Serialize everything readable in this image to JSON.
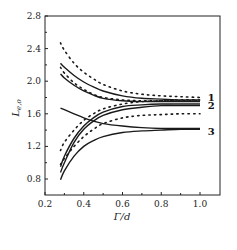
{
  "chart_data": {
    "type": "line",
    "title": "",
    "xlabel": "Γ/d",
    "ylabel": "L_{e,o}",
    "xlim": [
      0.2,
      1.1
    ],
    "ylim": [
      0.6,
      2.8
    ],
    "xticks": [
      0.2,
      0.4,
      0.6,
      0.8,
      1.0
    ],
    "xtick_labels": [
      "0.2",
      "0.4",
      "0.6",
      "0.8",
      "1.0"
    ],
    "yticks": [
      0.8,
      1.2,
      1.6,
      2.0,
      2.4,
      2.8
    ],
    "ytick_labels": [
      "0.8",
      "1.2",
      "1.6",
      "2.0",
      "2.4",
      "2.8"
    ],
    "grid": false,
    "x": [
      0.28,
      0.3,
      0.35,
      0.4,
      0.45,
      0.5,
      0.6,
      0.7,
      0.8,
      0.9,
      1.0
    ],
    "series": [
      {
        "name": "1 (solid, upper)",
        "style": "solid",
        "values": [
          2.22,
          2.17,
          2.07,
          1.99,
          1.93,
          1.88,
          1.82,
          1.79,
          1.78,
          1.77,
          1.77
        ]
      },
      {
        "name": "1 (solid, lower)",
        "style": "solid",
        "values": [
          2.09,
          2.04,
          1.95,
          1.88,
          1.83,
          1.79,
          1.76,
          1.75,
          1.75,
          1.75,
          1.75
        ]
      },
      {
        "name": "1 (dotted, upper)",
        "style": "dotted",
        "values": [
          2.47,
          2.38,
          2.22,
          2.11,
          2.03,
          1.96,
          1.88,
          1.84,
          1.82,
          1.81,
          1.8
        ]
      },
      {
        "name": "1 (dotted, lower)",
        "style": "dotted",
        "values": [
          2.17,
          2.1,
          1.98,
          1.9,
          1.84,
          1.8,
          1.77,
          1.76,
          1.76,
          1.76,
          1.76
        ]
      },
      {
        "name": "2 (solid, upper)",
        "style": "solid",
        "values": [
          0.95,
          1.08,
          1.3,
          1.45,
          1.55,
          1.62,
          1.69,
          1.71,
          1.72,
          1.72,
          1.72
        ]
      },
      {
        "name": "2 (solid, lower)",
        "style": "solid",
        "values": [
          0.88,
          1.0,
          1.25,
          1.41,
          1.51,
          1.58,
          1.65,
          1.68,
          1.7,
          1.7,
          1.7
        ]
      },
      {
        "name": "2 (dotted, upper)",
        "style": "dotted",
        "values": [
          1.15,
          1.25,
          1.4,
          1.52,
          1.6,
          1.66,
          1.72,
          1.75,
          1.76,
          1.77,
          1.77
        ]
      },
      {
        "name": "2 (dotted, lower)",
        "style": "dotted",
        "values": [
          0.98,
          1.05,
          1.2,
          1.32,
          1.41,
          1.48,
          1.55,
          1.58,
          1.59,
          1.6,
          1.6
        ]
      },
      {
        "name": "3 (solid, decreasing)",
        "style": "solid",
        "values": [
          1.67,
          1.65,
          1.6,
          1.55,
          1.51,
          1.48,
          1.45,
          1.43,
          1.42,
          1.42,
          1.42
        ]
      },
      {
        "name": "3 (solid, increasing)",
        "style": "solid",
        "values": [
          0.79,
          0.9,
          1.08,
          1.2,
          1.27,
          1.32,
          1.37,
          1.39,
          1.4,
          1.41,
          1.41
        ]
      }
    ],
    "annotations": [
      {
        "text": "1",
        "x": 1.04,
        "y": 1.8
      },
      {
        "text": "2",
        "x": 1.04,
        "y": 1.69
      },
      {
        "text": "3",
        "x": 1.04,
        "y": 1.38
      }
    ],
    "legend": "none (inline numeric labels at right)"
  },
  "colors": {
    "line": "#1a1a1a",
    "frame": "#222222",
    "background": "#ffffff"
  }
}
